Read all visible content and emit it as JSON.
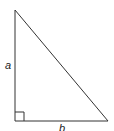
{
  "diagram": {
    "type": "right-triangle",
    "labels": {
      "vertical_side": "a",
      "horizontal_side": "b"
    },
    "vertices": {
      "top": [
        15,
        10
      ],
      "bottom_left": [
        15,
        121
      ],
      "bottom_right": [
        108,
        121
      ]
    },
    "right_angle_marker_size": 9,
    "stroke_color": "#333333",
    "background_color": "#ffffff"
  }
}
